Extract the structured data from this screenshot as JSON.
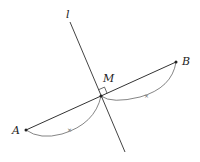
{
  "diagram": {
    "labels": {
      "line": "l",
      "midpoint": "M",
      "pointA": "A",
      "pointB": "B"
    },
    "points": {
      "A": [
        26,
        130
      ],
      "B": [
        176,
        62
      ],
      "M": [
        101,
        96
      ]
    },
    "line_l": {
      "from": [
        70,
        22
      ],
      "to": [
        125,
        152
      ]
    },
    "equal_marks": "×",
    "colors": {
      "stroke": "#333333",
      "arc": "#555555"
    }
  }
}
